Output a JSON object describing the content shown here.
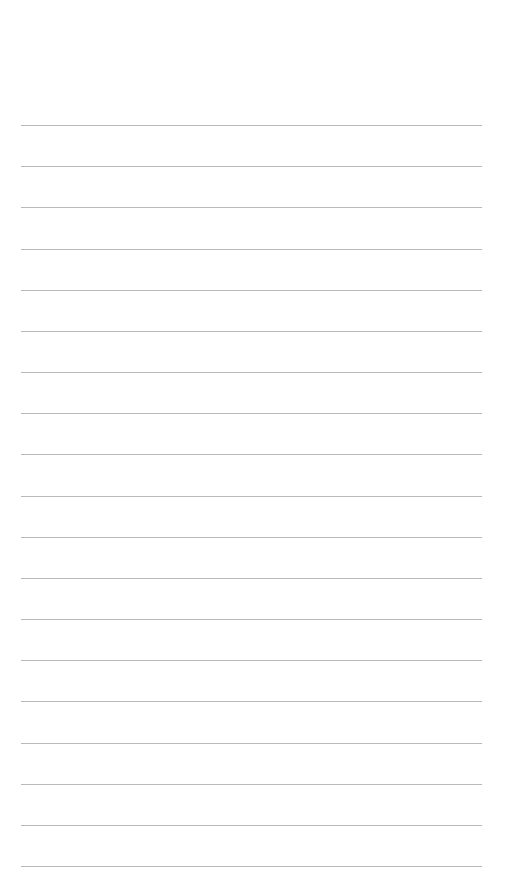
{
  "page": {
    "type": "lined-paper",
    "background": "#ffffff",
    "rule_color": "#b9b9b9",
    "rule_count": 19,
    "first_rule_y": 125,
    "rule_spacing": 41.17,
    "rule_left": 21,
    "rule_width": 461
  }
}
